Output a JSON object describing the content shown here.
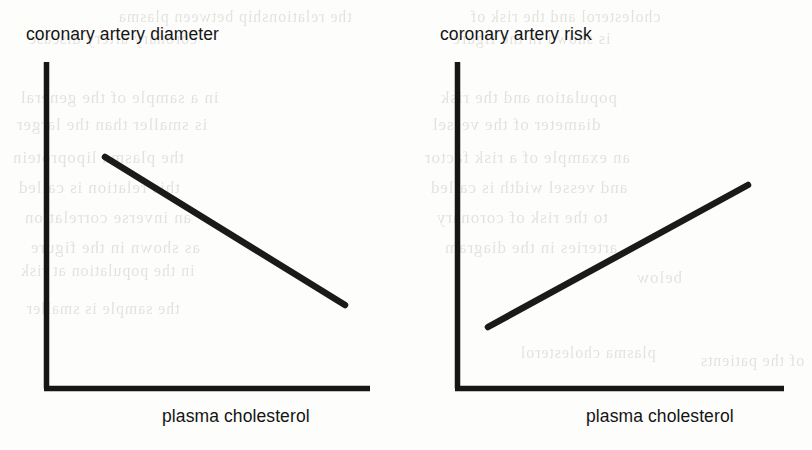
{
  "figure": {
    "background_color": "#fdfdfb",
    "ink_color": "#161616"
  },
  "charts": [
    {
      "id": "coronary-artery-diameter",
      "title": "coronary artery diameter",
      "xlabel": "plasma cholesterol"
    },
    {
      "id": "coronary-artery-risk",
      "title": "coronary artery risk",
      "xlabel": "plasma cholesterol"
    }
  ],
  "bleed_text": [
    {
      "text": "the relationship between plasma",
      "x": 118,
      "y": 8,
      "size": 16
    },
    {
      "text": "cholesterol and the risk of",
      "x": 470,
      "y": 8,
      "size": 16
    },
    {
      "text": "coronary artery disease",
      "x": 28,
      "y": 30,
      "size": 16
    },
    {
      "text": "is shown in the figure",
      "x": 452,
      "y": 30,
      "size": 16
    },
    {
      "text": "in a sample of the general",
      "x": 20,
      "y": 88,
      "size": 17
    },
    {
      "text": "population and the risk",
      "x": 440,
      "y": 88,
      "size": 17
    },
    {
      "text": "is smaller than the larger",
      "x": 16,
      "y": 115,
      "size": 17
    },
    {
      "text": "diameter of the vessel",
      "x": 432,
      "y": 115,
      "size": 17
    },
    {
      "text": "the plasma lipoprotein",
      "x": 12,
      "y": 148,
      "size": 17
    },
    {
      "text": "an example of a risk factor",
      "x": 424,
      "y": 148,
      "size": 17
    },
    {
      "text": "this relation is called",
      "x": 18,
      "y": 178,
      "size": 17
    },
    {
      "text": "and vessel width is called",
      "x": 430,
      "y": 178,
      "size": 17
    },
    {
      "text": "an inverse correlation",
      "x": 24,
      "y": 208,
      "size": 17
    },
    {
      "text": "to the risk of coronary",
      "x": 436,
      "y": 208,
      "size": 17
    },
    {
      "text": "as shown in the figure",
      "x": 30,
      "y": 238,
      "size": 17
    },
    {
      "text": "arteries in the diagram",
      "x": 444,
      "y": 238,
      "size": 17
    },
    {
      "text": "below",
      "x": 636,
      "y": 268,
      "size": 17
    },
    {
      "text": "in the population at risk",
      "x": 20,
      "y": 262,
      "size": 16
    },
    {
      "text": "the sample is smaller",
      "x": 26,
      "y": 300,
      "size": 16
    },
    {
      "text": "plasma cholesterol",
      "x": 520,
      "y": 344,
      "size": 16
    },
    {
      "text": "of the patients",
      "x": 700,
      "y": 352,
      "size": 16
    }
  ],
  "chart_data": [
    {
      "type": "line",
      "title": "coronary artery diameter",
      "xlabel": "plasma cholesterol",
      "ylabel": "coronary artery diameter",
      "grid": false,
      "legend": "none",
      "axis_ticks": false,
      "xlim": [
        0,
        100
      ],
      "ylim": [
        0,
        100
      ],
      "series": [
        {
          "name": "coronary artery diameter vs plasma cholesterol",
          "trend": "decreasing",
          "x": [
            18,
            92
          ],
          "y": [
            71,
            26
          ]
        }
      ]
    },
    {
      "type": "line",
      "title": "coronary artery risk",
      "xlabel": "plasma cholesterol",
      "ylabel": "coronary artery risk",
      "grid": false,
      "legend": "none",
      "axis_ticks": false,
      "xlim": [
        0,
        100
      ],
      "ylim": [
        0,
        100
      ],
      "series": [
        {
          "name": "coronary artery risk vs plasma cholesterol",
          "trend": "increasing",
          "x": [
            10,
            90
          ],
          "y": [
            19,
            62
          ]
        }
      ]
    }
  ]
}
